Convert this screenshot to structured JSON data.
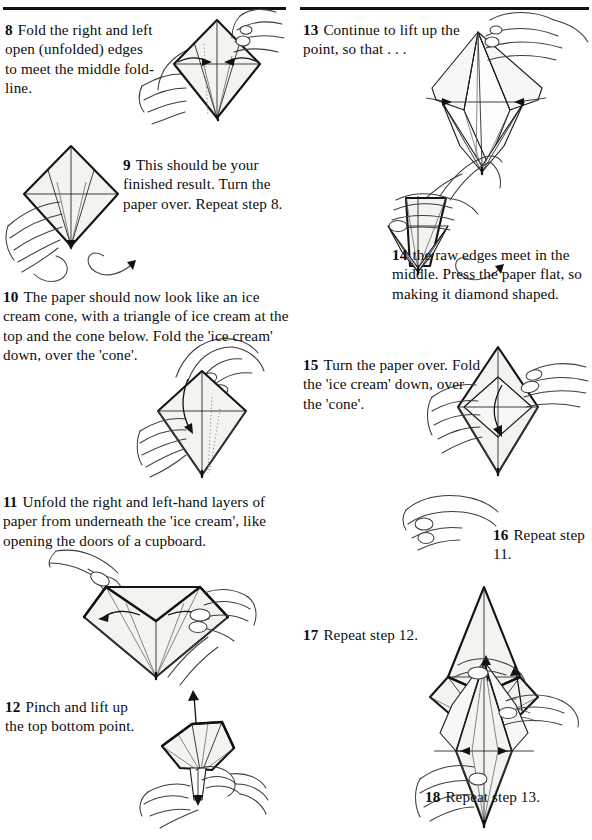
{
  "document": {
    "type": "origami-instruction-page",
    "rules": [
      "top-rule-left",
      "top-rule-right"
    ]
  },
  "steps": [
    {
      "id": "step-8",
      "number": "8",
      "text": "Fold the right and left open (unfolded) edges to meet the middle fold-line.",
      "column": "left",
      "figure": "kite-base-two-hands-arrows-inward"
    },
    {
      "id": "step-9",
      "number": "9",
      "text": "This should be your finished result. Turn the paper over. Repeat step 8.",
      "column": "left",
      "figure": "kite-base-finished-hand-turnover-arrow"
    },
    {
      "id": "step-10",
      "number": "10",
      "text": "The paper should now look like an ice cream cone, with a triangle of ice cream at the top and the cone below. Fold the 'ice cream' down, over the 'cone'.",
      "column": "left",
      "figure": "cone-diamond-fold-down-arrow"
    },
    {
      "id": "step-11",
      "number": "11",
      "text": "Unfold the right and left-hand layers of paper from underneath the 'ice cream', like opening the doors of a cupboard.",
      "column": "left",
      "figure": "opened-doors-two-hands-outward-arrows"
    },
    {
      "id": "step-12",
      "number": "12",
      "text": "Pinch and lift up the top bottom point.",
      "column": "left",
      "figure": "fan-shape-pinch-lift-up-arrow"
    },
    {
      "id": "step-13",
      "number": "13",
      "text": "Continue to lift up the point, so that . . .",
      "column": "right",
      "figure": "tall-lifted-point-two-hands"
    },
    {
      "id": "step-14",
      "number": "14",
      "text": "the raw edges meet in the middle. Press the paper flat, so making it diamond shaped.",
      "column": "right",
      "figure": "pressed-diamond-hand-turnover-arrow"
    },
    {
      "id": "step-15",
      "number": "15",
      "text": "Turn the paper over. Fold the 'ice cream' down, over the 'cone'.",
      "column": "right",
      "figure": "diamond-fold-down-two-hands"
    },
    {
      "id": "step-16",
      "number": "16",
      "text": "Repeat step 11.",
      "column": "right",
      "figure": "hand-sketch"
    },
    {
      "id": "step-17",
      "number": "17",
      "text": "Repeat step 12.",
      "column": "right",
      "figure": "tall-peak-with-lift-arrow"
    },
    {
      "id": "step-18",
      "number": "18",
      "text": "Repeat step 13.",
      "column": "right",
      "figure": "narrow-diamond-pinch-hands"
    }
  ],
  "colors": {
    "paper_fill": "#f3f3f0",
    "ink": "#141414",
    "hand_line": "#3e3e3e",
    "crease": "#1d1d1d",
    "page_background": "#ffffff"
  }
}
